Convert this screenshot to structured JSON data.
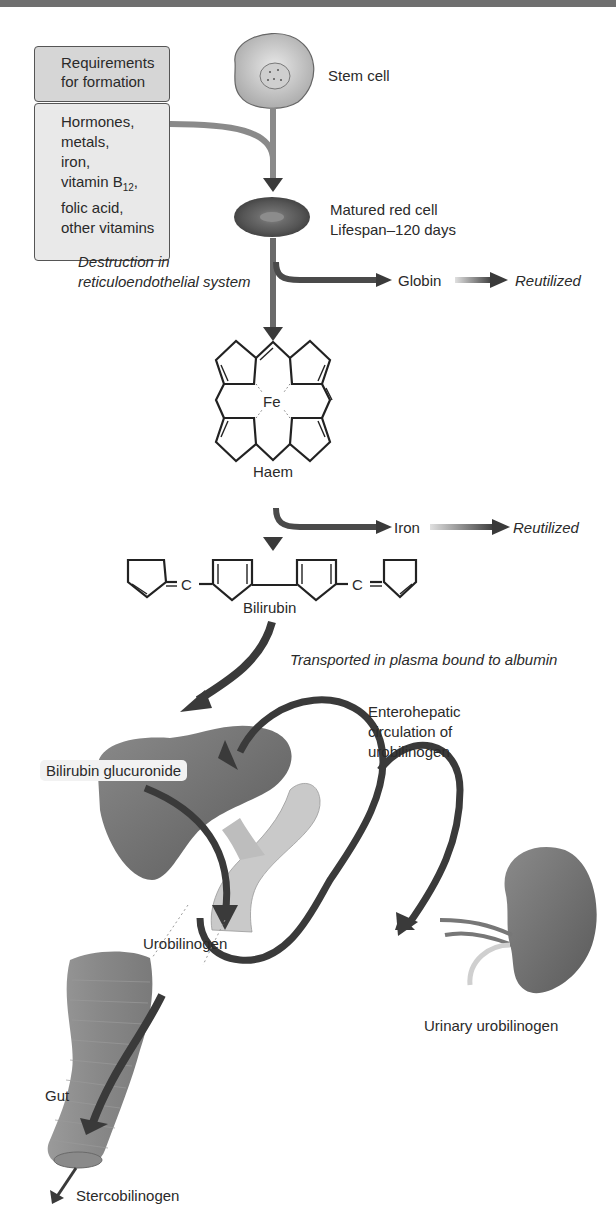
{
  "requirements": {
    "title_line1": "Requirements",
    "title_line2": "for formation",
    "items": [
      "Hormones,",
      "metals,",
      "iron,",
      "vitamin B",
      "folic acid,",
      "other vitamins"
    ],
    "b12_subscript": "12",
    "b12_suffix": ","
  },
  "stages": {
    "stem_cell": "Stem cell",
    "red_cell_line1": "Matured red cell",
    "red_cell_line2": "Lifespan–120 days",
    "destruction_line1": "Destruction in",
    "destruction_line2": "reticuloendothelial system",
    "globin": "Globin",
    "globin_fate": "Reutilized",
    "haem_center": "Fe",
    "haem": "Haem",
    "iron": "Iron",
    "iron_fate": "Reutilized",
    "bilirubin_c1": "C",
    "bilirubin_c2": "C",
    "bilirubin": "Bilirubin",
    "transport": "Transported in plasma bound to albumin",
    "entero_line1": "Enterohepatic",
    "entero_line2": "circulation of",
    "entero_line3": "urobilinogen",
    "bilirubin_glucuronide": "Bilirubin glucuronide",
    "urobilinogen": "Urobilinogen",
    "urinary": "Urinary urobilinogen",
    "gut": "Gut",
    "stercobilinogen": "Stercobilinogen"
  },
  "colors": {
    "arrow": "#3a3a3a",
    "box_head": "#d6d6d6",
    "box_body": "#e9e9e9",
    "organ": "#6e6e6e",
    "duct": "#c8c8c8"
  }
}
